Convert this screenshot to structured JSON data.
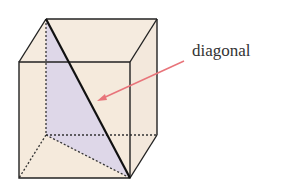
{
  "diagram": {
    "label": "diagonal",
    "colors": {
      "face_fill": "#f3e6d6",
      "triangle_fill": "#d9d3ea",
      "edge": "#222222",
      "arrow": "#e8747a",
      "label": "#333333"
    }
  }
}
